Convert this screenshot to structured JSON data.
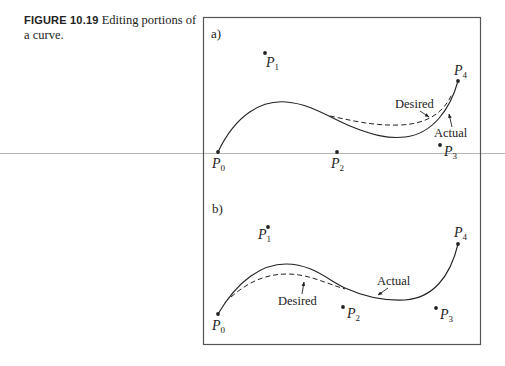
{
  "caption": {
    "figure_number": "FIGURE 10.19",
    "text": "Editing portions of a curve."
  },
  "panels": [
    {
      "label": "a)",
      "points": [
        {
          "name": "P",
          "sub": "0"
        },
        {
          "name": "P",
          "sub": "1"
        },
        {
          "name": "P",
          "sub": "2"
        },
        {
          "name": "P",
          "sub": "3"
        },
        {
          "name": "P",
          "sub": "4"
        }
      ],
      "annotations": {
        "desired": "Desired",
        "actual": "Actual"
      }
    },
    {
      "label": "b)",
      "points": [
        {
          "name": "P",
          "sub": "0"
        },
        {
          "name": "P",
          "sub": "1"
        },
        {
          "name": "P",
          "sub": "2"
        },
        {
          "name": "P",
          "sub": "3"
        },
        {
          "name": "P",
          "sub": "4"
        }
      ],
      "annotations": {
        "desired": "Desired",
        "actual": "Actual"
      }
    }
  ],
  "colors": {
    "ink": "#222222",
    "frame": "#555555",
    "rule": "#b5b5b5"
  }
}
